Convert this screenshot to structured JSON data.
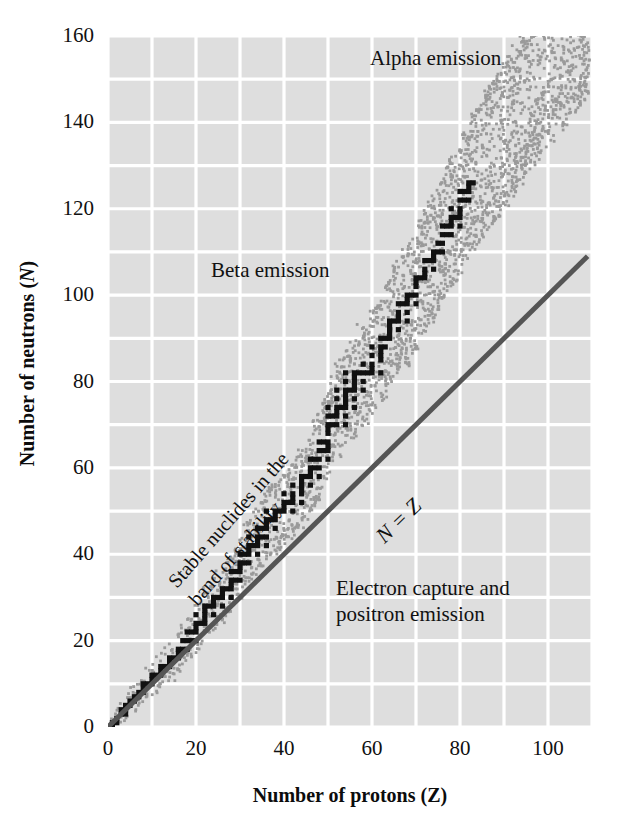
{
  "chart_data": {
    "type": "scatter",
    "title": "",
    "xlabel": "Number of protons (Z)",
    "ylabel": "Number of neutrons (N)",
    "xlabel_plain": "Number of protons",
    "xlabel_symbol": "Z",
    "ylabel_plain": "Number of neutrons",
    "ylabel_symbol": "N",
    "xlim": [
      0,
      110
    ],
    "ylim": [
      0,
      160
    ],
    "xticks": [
      0,
      20,
      40,
      60,
      80,
      100
    ],
    "yticks": [
      0,
      20,
      40,
      60,
      80,
      100,
      120,
      140,
      160
    ],
    "xtick_labels": [
      "0",
      "20",
      "40",
      "60",
      "80",
      "100"
    ],
    "ytick_labels": [
      "0",
      "20",
      "40",
      "60",
      "80",
      "100",
      "120",
      "140",
      "160"
    ],
    "grid": true,
    "grid_spacing_x": 10,
    "grid_spacing_y": 10,
    "grid_color": "#ffffff",
    "plot_background": "#dedede",
    "legend": "none",
    "annotations": [
      {
        "id": "alpha-emission",
        "text": "Alpha emission",
        "x": 62,
        "y": 155,
        "rotation": 0
      },
      {
        "id": "beta-emission",
        "text": "Beta emission",
        "x": 26,
        "y": 106,
        "rotation": 0
      },
      {
        "id": "stable-band",
        "text": "Stable nuclides in the band of stability",
        "line1": "Stable nuclides in the",
        "line2": "band of stability",
        "x": 14,
        "y": 58,
        "rotation": -49
      },
      {
        "id": "n-equals-z",
        "text": "N = Z",
        "x": 62,
        "y": 55,
        "rotation": -44
      },
      {
        "id": "electron-capture",
        "text": "Electron capture and positron emission",
        "line1": "Electron capture and",
        "line2": "positron emission",
        "x": 56,
        "y": 43,
        "rotation": 0
      }
    ],
    "series": [
      {
        "name": "N = Z reference line",
        "type": "line",
        "color": "#555555",
        "width": 5,
        "points": [
          [
            0,
            0
          ],
          [
            109,
            109
          ]
        ]
      },
      {
        "name": "Stable nuclides (band of stability)",
        "type": "scatter",
        "color": "#111111",
        "marker": "square",
        "description": "Black squares tracing the stable nuclide band; N approximately equals Z at low Z and curves to N/Z ~ 1.5 near Z = 83",
        "points": [
          [
            1,
            0
          ],
          [
            1,
            1
          ],
          [
            2,
            1
          ],
          [
            2,
            2
          ],
          [
            3,
            3
          ],
          [
            3,
            4
          ],
          [
            4,
            3
          ],
          [
            4,
            4
          ],
          [
            4,
            5
          ],
          [
            5,
            5
          ],
          [
            5,
            6
          ],
          [
            6,
            6
          ],
          [
            6,
            7
          ],
          [
            7,
            7
          ],
          [
            7,
            8
          ],
          [
            8,
            8
          ],
          [
            8,
            9
          ],
          [
            8,
            10
          ],
          [
            9,
            10
          ],
          [
            10,
            10
          ],
          [
            10,
            11
          ],
          [
            10,
            12
          ],
          [
            11,
            12
          ],
          [
            12,
            12
          ],
          [
            12,
            13
          ],
          [
            12,
            14
          ],
          [
            13,
            14
          ],
          [
            14,
            14
          ],
          [
            14,
            15
          ],
          [
            14,
            16
          ],
          [
            15,
            16
          ],
          [
            16,
            16
          ],
          [
            16,
            17
          ],
          [
            16,
            18
          ],
          [
            17,
            18
          ],
          [
            17,
            20
          ],
          [
            18,
            18
          ],
          [
            18,
            20
          ],
          [
            18,
            22
          ],
          [
            19,
            20
          ],
          [
            19,
            22
          ],
          [
            20,
            20
          ],
          [
            20,
            22
          ],
          [
            20,
            23
          ],
          [
            20,
            24
          ],
          [
            20,
            26
          ],
          [
            21,
            24
          ],
          [
            22,
            24
          ],
          [
            22,
            25
          ],
          [
            22,
            26
          ],
          [
            22,
            27
          ],
          [
            22,
            28
          ],
          [
            23,
            28
          ],
          [
            24,
            26
          ],
          [
            24,
            28
          ],
          [
            24,
            29
          ],
          [
            24,
            30
          ],
          [
            25,
            30
          ],
          [
            26,
            28
          ],
          [
            26,
            30
          ],
          [
            26,
            31
          ],
          [
            26,
            32
          ],
          [
            27,
            32
          ],
          [
            28,
            30
          ],
          [
            28,
            32
          ],
          [
            28,
            33
          ],
          [
            28,
            34
          ],
          [
            28,
            36
          ],
          [
            29,
            34
          ],
          [
            29,
            36
          ],
          [
            30,
            34
          ],
          [
            30,
            36
          ],
          [
            30,
            37
          ],
          [
            30,
            38
          ],
          [
            30,
            40
          ],
          [
            31,
            38
          ],
          [
            31,
            40
          ],
          [
            32,
            38
          ],
          [
            32,
            40
          ],
          [
            32,
            41
          ],
          [
            32,
            42
          ],
          [
            32,
            44
          ],
          [
            33,
            42
          ],
          [
            34,
            40
          ],
          [
            34,
            42
          ],
          [
            34,
            43
          ],
          [
            34,
            44
          ],
          [
            34,
            46
          ],
          [
            35,
            44
          ],
          [
            35,
            46
          ],
          [
            36,
            42
          ],
          [
            36,
            44
          ],
          [
            36,
            46
          ],
          [
            36,
            47
          ],
          [
            36,
            48
          ],
          [
            36,
            50
          ],
          [
            37,
            48
          ],
          [
            38,
            46
          ],
          [
            38,
            48
          ],
          [
            38,
            49
          ],
          [
            38,
            50
          ],
          [
            39,
            50
          ],
          [
            40,
            50
          ],
          [
            40,
            51
          ],
          [
            40,
            52
          ],
          [
            40,
            54
          ],
          [
            41,
            52
          ],
          [
            42,
            50
          ],
          [
            42,
            52
          ],
          [
            42,
            53
          ],
          [
            42,
            54
          ],
          [
            42,
            56
          ],
          [
            44,
            52
          ],
          [
            44,
            54
          ],
          [
            44,
            55
          ],
          [
            44,
            56
          ],
          [
            44,
            57
          ],
          [
            44,
            58
          ],
          [
            45,
            58
          ],
          [
            46,
            56
          ],
          [
            46,
            58
          ],
          [
            46,
            59
          ],
          [
            46,
            60
          ],
          [
            46,
            62
          ],
          [
            47,
            60
          ],
          [
            47,
            62
          ],
          [
            48,
            58
          ],
          [
            48,
            60
          ],
          [
            48,
            62
          ],
          [
            48,
            64
          ],
          [
            48,
            66
          ],
          [
            49,
            64
          ],
          [
            49,
            66
          ],
          [
            50,
            62
          ],
          [
            50,
            64
          ],
          [
            50,
            65
          ],
          [
            50,
            66
          ],
          [
            50,
            68
          ],
          [
            50,
            69
          ],
          [
            50,
            70
          ],
          [
            50,
            72
          ],
          [
            50,
            74
          ],
          [
            51,
            70
          ],
          [
            51,
            72
          ],
          [
            52,
            70
          ],
          [
            52,
            72
          ],
          [
            52,
            73
          ],
          [
            52,
            74
          ],
          [
            52,
            76
          ],
          [
            52,
            78
          ],
          [
            53,
            74
          ],
          [
            54,
            70
          ],
          [
            54,
            72
          ],
          [
            54,
            74
          ],
          [
            54,
            75
          ],
          [
            54,
            76
          ],
          [
            54,
            77
          ],
          [
            54,
            78
          ],
          [
            54,
            80
          ],
          [
            54,
            82
          ],
          [
            55,
            78
          ],
          [
            56,
            74
          ],
          [
            56,
            76
          ],
          [
            56,
            78
          ],
          [
            56,
            79
          ],
          [
            56,
            80
          ],
          [
            56,
            81
          ],
          [
            56,
            82
          ],
          [
            57,
            82
          ],
          [
            58,
            78
          ],
          [
            58,
            80
          ],
          [
            58,
            82
          ],
          [
            58,
            84
          ],
          [
            59,
            82
          ],
          [
            60,
            82
          ],
          [
            60,
            83
          ],
          [
            60,
            84
          ],
          [
            60,
            86
          ],
          [
            60,
            88
          ],
          [
            62,
            82
          ],
          [
            62,
            85
          ],
          [
            62,
            86
          ],
          [
            62,
            87
          ],
          [
            62,
            88
          ],
          [
            62,
            90
          ],
          [
            63,
            88
          ],
          [
            63,
            90
          ],
          [
            64,
            90
          ],
          [
            64,
            91
          ],
          [
            64,
            92
          ],
          [
            64,
            93
          ],
          [
            64,
            94
          ],
          [
            65,
            94
          ],
          [
            66,
            92
          ],
          [
            66,
            94
          ],
          [
            66,
            95
          ],
          [
            66,
            96
          ],
          [
            66,
            98
          ],
          [
            67,
            98
          ],
          [
            68,
            94
          ],
          [
            68,
            96
          ],
          [
            68,
            98
          ],
          [
            68,
            99
          ],
          [
            68,
            100
          ],
          [
            69,
            100
          ],
          [
            70,
            98
          ],
          [
            70,
            100
          ],
          [
            70,
            102
          ],
          [
            70,
            103
          ],
          [
            70,
            104
          ],
          [
            71,
            104
          ],
          [
            72,
            104
          ],
          [
            72,
            105
          ],
          [
            72,
            106
          ],
          [
            72,
            108
          ],
          [
            73,
            108
          ],
          [
            74,
            106
          ],
          [
            74,
            108
          ],
          [
            74,
            109
          ],
          [
            74,
            110
          ],
          [
            75,
            110
          ],
          [
            75,
            112
          ],
          [
            76,
            110
          ],
          [
            76,
            112
          ],
          [
            76,
            114
          ],
          [
            76,
            116
          ],
          [
            77,
            114
          ],
          [
            77,
            116
          ],
          [
            78,
            114
          ],
          [
            78,
            116
          ],
          [
            78,
            117
          ],
          [
            78,
            118
          ],
          [
            78,
            120
          ],
          [
            79,
            118
          ],
          [
            80,
            116
          ],
          [
            80,
            118
          ],
          [
            80,
            119
          ],
          [
            80,
            120
          ],
          [
            80,
            122
          ],
          [
            80,
            124
          ],
          [
            81,
            122
          ],
          [
            81,
            124
          ],
          [
            82,
            122
          ],
          [
            82,
            124
          ],
          [
            82,
            125
          ],
          [
            82,
            126
          ],
          [
            83,
            126
          ]
        ]
      },
      {
        "name": "Unstable / radioactive nuclides halo",
        "type": "scatter",
        "color": "#9a9a9a",
        "marker": "dot",
        "description": "Sparse dotted halo of known radioactive nuclides flanking the band of stability, widening toward high Z and extending to Z ~ 109, N ~ 158"
      }
    ]
  }
}
